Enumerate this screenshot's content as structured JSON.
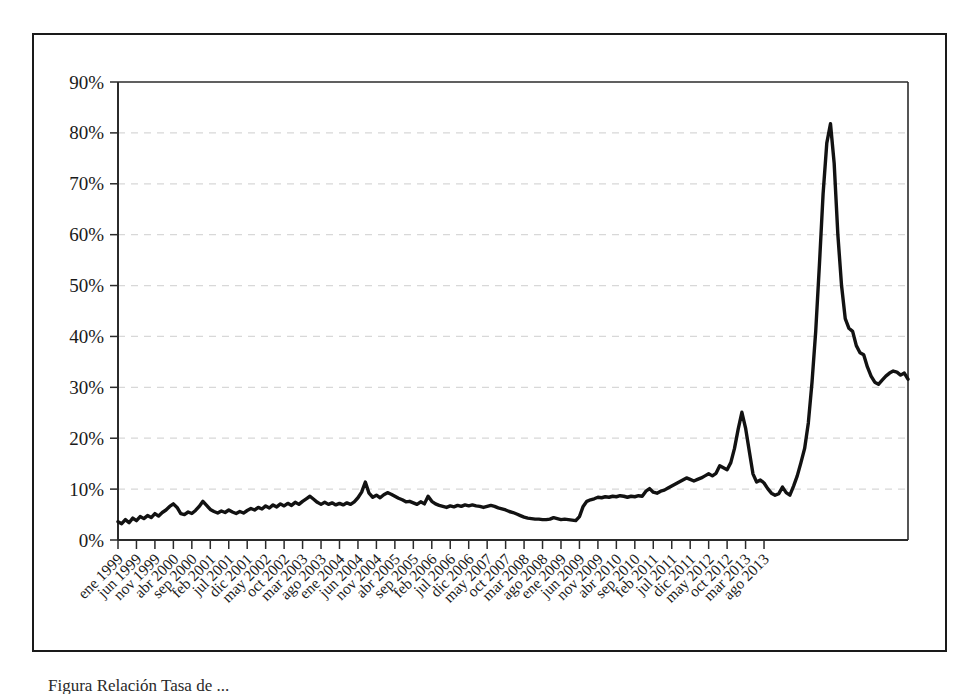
{
  "figure": {
    "caption_partial": "Figura     Relación Tasa de ...",
    "frame_color": "#1a1a1a",
    "line_color": "#121212",
    "grid_color": "#d8d8d8"
  },
  "chart_data": {
    "type": "line",
    "title": "",
    "xlabel": "",
    "ylabel": "",
    "ylim": [
      0,
      90
    ],
    "yticks": [
      0,
      10,
      20,
      30,
      40,
      50,
      60,
      70,
      80,
      90
    ],
    "ytick_labels": [
      "0%",
      "10%",
      "20%",
      "30%",
      "40%",
      "50%",
      "60%",
      "70%",
      "80%",
      "90%"
    ],
    "grid": true,
    "grid_style": "dashed-horizontal",
    "legend": null,
    "value_unit": "percent",
    "xtick_labels": [
      "ene 1999",
      "jun 1999",
      "nov 1999",
      "abr 2000",
      "sep 2000",
      "feb 2001",
      "jul 2001",
      "dic 2001",
      "may 2002",
      "oct 2002",
      "mar 2003",
      "ago 2003",
      "ene 2004",
      "jun 2004",
      "nov 2004",
      "abr 2005",
      "sep 2005",
      "feb 2006",
      "jul 2006",
      "dic 2006",
      "may 2007",
      "oct 2007",
      "mar 2008",
      "ago 2008",
      "ene 2009",
      "jun 2009",
      "nov 2009",
      "abr 2010",
      "sep 2010",
      "feb 2011",
      "jul 2011",
      "dic 2011",
      "may 2012",
      "oct 2012",
      "mar 2013",
      "ago 2013"
    ],
    "xtick_interval_months": 5,
    "x_start_label": "ene 1999",
    "x_end_label": "ago 2013",
    "series": [
      {
        "name": "serie",
        "values": [
          3.6,
          3.2,
          4.0,
          3.4,
          4.3,
          3.8,
          4.6,
          4.2,
          4.8,
          4.4,
          5.2,
          4.7,
          5.4,
          5.9,
          6.6,
          7.1,
          6.4,
          5.2,
          5.0,
          5.5,
          5.2,
          5.8,
          6.6,
          7.6,
          6.8,
          6.0,
          5.6,
          5.3,
          5.7,
          5.4,
          5.9,
          5.5,
          5.2,
          5.6,
          5.3,
          5.8,
          6.2,
          5.9,
          6.4,
          6.1,
          6.7,
          6.3,
          6.9,
          6.5,
          7.1,
          6.7,
          7.2,
          6.8,
          7.4,
          7.0,
          7.6,
          8.1,
          8.6,
          8.0,
          7.4,
          7.0,
          7.4,
          7.0,
          7.3,
          6.9,
          7.2,
          6.9,
          7.3,
          7.0,
          7.5,
          8.3,
          9.4,
          11.4,
          9.2,
          8.4,
          8.8,
          8.3,
          8.9,
          9.3,
          9.0,
          8.6,
          8.2,
          7.9,
          7.5,
          7.6,
          7.3,
          7.0,
          7.5,
          7.1,
          8.6,
          7.6,
          7.1,
          6.8,
          6.6,
          6.4,
          6.7,
          6.5,
          6.8,
          6.6,
          6.9,
          6.7,
          6.9,
          6.7,
          6.6,
          6.4,
          6.6,
          6.8,
          6.6,
          6.3,
          6.1,
          5.9,
          5.6,
          5.4,
          5.1,
          4.8,
          4.5,
          4.3,
          4.2,
          4.1,
          4.1,
          4.0,
          4.0,
          4.1,
          4.4,
          4.2,
          4.0,
          4.1,
          4.0,
          3.9,
          3.8,
          4.6,
          6.6,
          7.6,
          7.9,
          8.1,
          8.4,
          8.3,
          8.5,
          8.4,
          8.6,
          8.5,
          8.7,
          8.6,
          8.4,
          8.6,
          8.5,
          8.7,
          8.6,
          9.6,
          10.1,
          9.4,
          9.2,
          9.6,
          9.8,
          10.2,
          10.6,
          11.0,
          11.4,
          11.8,
          12.2,
          11.9,
          11.6,
          11.9,
          12.2,
          12.6,
          13.0,
          12.6,
          13.1,
          14.6,
          14.2,
          13.8,
          15.2,
          18.0,
          21.8,
          25.1,
          22.0,
          17.5,
          13.0,
          11.4,
          11.8,
          11.2,
          10.1,
          9.2,
          8.8,
          9.1,
          10.4,
          9.3,
          8.8,
          10.6,
          12.6,
          15.2,
          18.0,
          23.0,
          31.0,
          41.0,
          54.0,
          68.0,
          78.0,
          81.8,
          74.0,
          60.0,
          50.0,
          43.5,
          41.6,
          41.0,
          38.2,
          36.8,
          36.4,
          34.0,
          32.2,
          31.0,
          30.6,
          31.4,
          32.2,
          32.8,
          33.2,
          33.0,
          32.4,
          32.8,
          31.6
        ]
      }
    ]
  }
}
